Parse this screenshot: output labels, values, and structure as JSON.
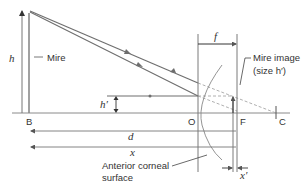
{
  "diagram": {
    "colors": {
      "ray": "#6e6e6e",
      "axis": "#8a8a8a",
      "dashed": "#b0b0b0",
      "text": "#333333"
    },
    "labels": {
      "h": "h",
      "mire": "Mire",
      "f": "f",
      "mire_image_line1": "Mire image",
      "mire_image_line2": "(size h′)",
      "h_prime": "h′",
      "B": "B",
      "O": "O",
      "F": "F",
      "C": "C",
      "d": "d",
      "x": "x",
      "x_prime": "x′",
      "cornea_line1": "Anterior corneal",
      "cornea_line2": "surface"
    }
  }
}
